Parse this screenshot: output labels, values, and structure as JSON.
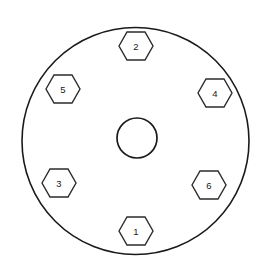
{
  "diagram": {
    "background_color": "#ffffff",
    "line_color": "#1a1a1a",
    "hex_stroke_color": "#2b2b2b",
    "label_color": "#1a1a1a"
  },
  "outer_circle": {
    "name": "outer-circle",
    "cx": 135.5,
    "cy": 141,
    "r": 113.5
  },
  "center_circle": {
    "name": "center-bore",
    "cx": 137,
    "cy": 138,
    "r": 20
  },
  "hex_geometry": {
    "half_width": 17,
    "half_height": 14,
    "flat_half_width": 9
  },
  "bolts": [
    {
      "label": "2",
      "cx": 136,
      "cy": 46
    },
    {
      "label": "5",
      "cx": 63,
      "cy": 89
    },
    {
      "label": "4",
      "cx": 215,
      "cy": 93
    },
    {
      "label": "3",
      "cx": 59,
      "cy": 183
    },
    {
      "label": "6",
      "cx": 209,
      "cy": 185
    },
    {
      "label": "1",
      "cx": 136,
      "cy": 231
    }
  ]
}
